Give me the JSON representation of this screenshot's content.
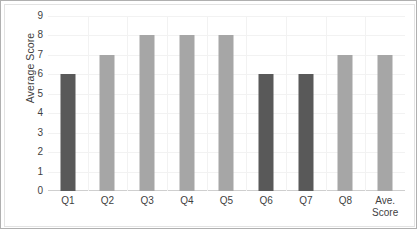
{
  "chart_data": {
    "type": "bar",
    "title": "",
    "xlabel": "",
    "ylabel": "Average Score",
    "categories": [
      "Q1",
      "Q2",
      "Q3",
      "Q4",
      "Q5",
      "Q6",
      "Q7",
      "Q8",
      "Ave. Score"
    ],
    "values": [
      6,
      7,
      8,
      8,
      8,
      6,
      6,
      7,
      7
    ],
    "ylim": [
      0,
      9
    ],
    "yticks": [
      0,
      1,
      2,
      3,
      4,
      5,
      6,
      7,
      8,
      9
    ],
    "ytick_labels": [
      "0",
      "1",
      "2",
      "3",
      "4",
      "5",
      "6",
      "7",
      "8",
      "9"
    ],
    "grid": true,
    "legend": "none",
    "bar_colors": [
      "#595959",
      "#a6a6a6",
      "#a6a6a6",
      "#a6a6a6",
      "#a6a6a6",
      "#595959",
      "#595959",
      "#a6a6a6",
      "#a6a6a6"
    ],
    "colors": {
      "dark_bar": "#595959",
      "light_bar": "#a6a6a6",
      "gridline": "#f2f2f2",
      "axis_line": "#cfcfcf",
      "frame_border": "#b0b0b0",
      "plot_background": "#ffffff",
      "tick_label": "#3f3f3f",
      "axis_title": "#404040"
    }
  }
}
